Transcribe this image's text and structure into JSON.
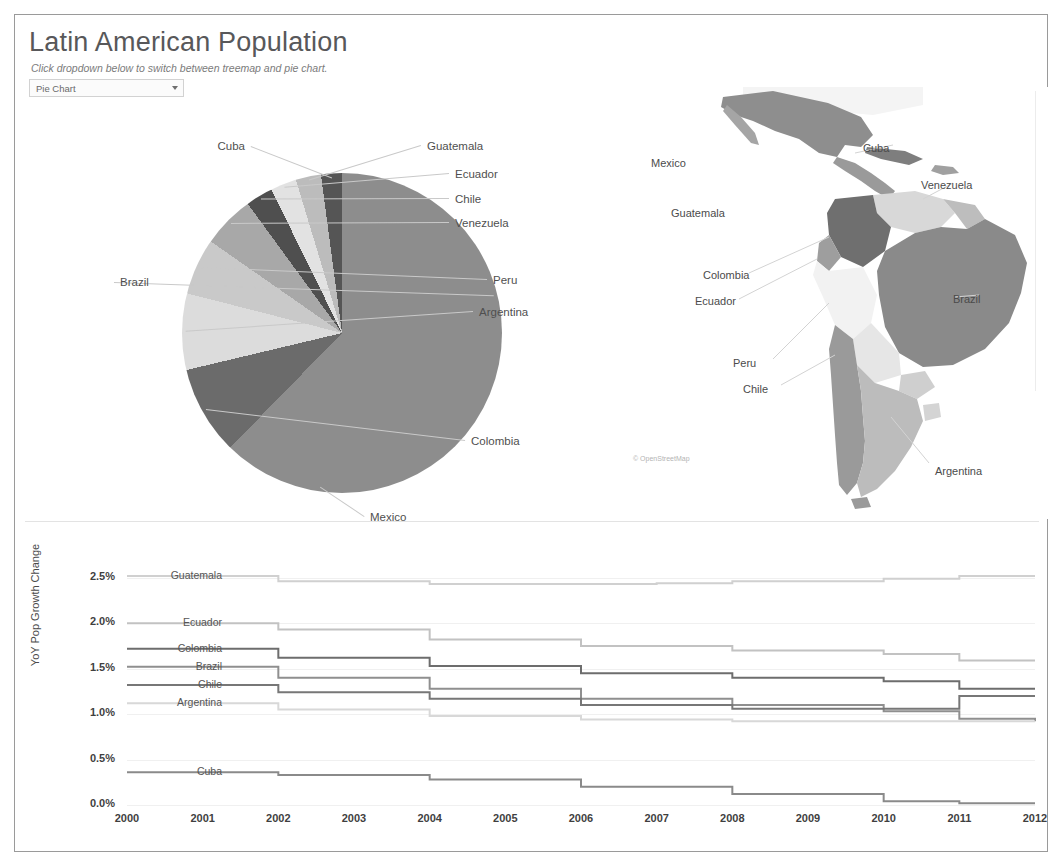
{
  "header": {
    "title": "Latin American Population",
    "subtitle": "Click dropdown below to switch between treemap and pie chart.",
    "chart_selector": {
      "selected": "Pie Chart",
      "options": [
        "Pie Chart",
        "Treemap"
      ],
      "arrow_icon": "chevron-down-icon"
    }
  },
  "map": {
    "attribution": "© OpenStreetMap",
    "labels": [
      {
        "name": "Mexico",
        "x": 28,
        "y": 70
      },
      {
        "name": "Cuba",
        "x": 240,
        "y": 55
      },
      {
        "name": "Venezuela",
        "x": 298,
        "y": 92
      },
      {
        "name": "Guatemala",
        "x": 48,
        "y": 120
      },
      {
        "name": "Colombia",
        "x": 80,
        "y": 182
      },
      {
        "name": "Ecuador",
        "x": 72,
        "y": 208
      },
      {
        "name": "Brazil",
        "x": 330,
        "y": 206
      },
      {
        "name": "Peru",
        "x": 110,
        "y": 270
      },
      {
        "name": "Chile",
        "x": 120,
        "y": 296
      },
      {
        "name": "Argentina",
        "x": 312,
        "y": 378
      }
    ]
  },
  "line_chart_labels": {
    "y_axis_title": "YoY Pop Growth Change"
  },
  "chart_data": [
    {
      "type": "pie",
      "title": "Latin American Population",
      "legend": "labeled-callouts",
      "categories": [
        "Brazil",
        "Mexico",
        "Colombia",
        "Argentina",
        "Peru",
        "Venezuela",
        "Chile",
        "Ecuador",
        "Guatemala",
        "Cuba"
      ],
      "values": [
        40.0,
        19.0,
        8.5,
        7.3,
        5.4,
        5.0,
        2.6,
        2.5,
        2.4,
        2.0
      ],
      "unit": "percent of total population",
      "labels": [
        {
          "name": "Cuba",
          "lx": 230,
          "ly": 41,
          "anchor": "end"
        },
        {
          "name": "Guatemala",
          "lx": 412,
          "ly": 41,
          "anchor": "start"
        },
        {
          "name": "Ecuador",
          "lx": 440,
          "ly": 69,
          "anchor": "start"
        },
        {
          "name": "Chile",
          "lx": 440,
          "ly": 94,
          "anchor": "start"
        },
        {
          "name": "Venezuela",
          "lx": 440,
          "ly": 118,
          "anchor": "start"
        },
        {
          "name": "Peru",
          "lx": 478,
          "ly": 175,
          "anchor": "start"
        },
        {
          "name": "Argentina",
          "lx": 464,
          "ly": 207,
          "anchor": "start"
        },
        {
          "name": "Colombia",
          "lx": 456,
          "ly": 336,
          "anchor": "start"
        },
        {
          "name": "Mexico",
          "lx": 355,
          "ly": 412,
          "anchor": "start"
        },
        {
          "name": "Brazil",
          "lx": 105,
          "ly": 177,
          "anchor": "start"
        }
      ]
    },
    {
      "type": "line",
      "title": "",
      "xlabel": "",
      "ylabel": "YoY Pop Growth Change",
      "x": [
        2000,
        2001,
        2002,
        2003,
        2004,
        2005,
        2006,
        2007,
        2008,
        2009,
        2010,
        2011,
        2012
      ],
      "xticks": [
        "2000",
        "2001",
        "2002",
        "2003",
        "2004",
        "2005",
        "2006",
        "2007",
        "2008",
        "2009",
        "2010",
        "2011",
        "2012"
      ],
      "yticks": [
        "0.0%",
        "0.5%",
        "1.0%",
        "1.5%",
        "2.0%",
        "2.5%"
      ],
      "ylim": [
        0.0,
        2.75
      ],
      "grid": true,
      "legend": "inline-left-labels",
      "series": [
        {
          "name": "Guatemala",
          "values": [
            2.52,
            2.52,
            2.46,
            2.46,
            2.43,
            2.43,
            2.43,
            2.44,
            2.46,
            2.46,
            2.49,
            2.52,
            2.52
          ]
        },
        {
          "name": "Ecuador",
          "values": [
            2.0,
            2.0,
            1.93,
            1.93,
            1.82,
            1.82,
            1.75,
            1.75,
            1.7,
            1.7,
            1.66,
            1.59,
            1.59
          ]
        },
        {
          "name": "Colombia",
          "values": [
            1.72,
            1.72,
            1.62,
            1.62,
            1.53,
            1.53,
            1.45,
            1.45,
            1.4,
            1.4,
            1.36,
            1.28,
            1.28
          ]
        },
        {
          "name": "Brazil",
          "values": [
            1.52,
            1.52,
            1.4,
            1.4,
            1.28,
            1.28,
            1.17,
            1.17,
            1.1,
            1.1,
            1.03,
            0.95,
            0.92
          ]
        },
        {
          "name": "Chile",
          "values": [
            1.32,
            1.32,
            1.24,
            1.24,
            1.17,
            1.17,
            1.1,
            1.1,
            1.06,
            1.06,
            1.06,
            1.2,
            1.2
          ]
        },
        {
          "name": "Argentina",
          "values": [
            1.12,
            1.12,
            1.05,
            1.05,
            0.98,
            0.98,
            0.94,
            0.94,
            0.92,
            0.92,
            0.92,
            0.92,
            0.92
          ]
        },
        {
          "name": "Cuba",
          "values": [
            0.36,
            0.36,
            0.33,
            0.33,
            0.28,
            0.28,
            0.2,
            0.2,
            0.12,
            0.12,
            0.04,
            0.02,
            0.02
          ]
        }
      ]
    }
  ]
}
